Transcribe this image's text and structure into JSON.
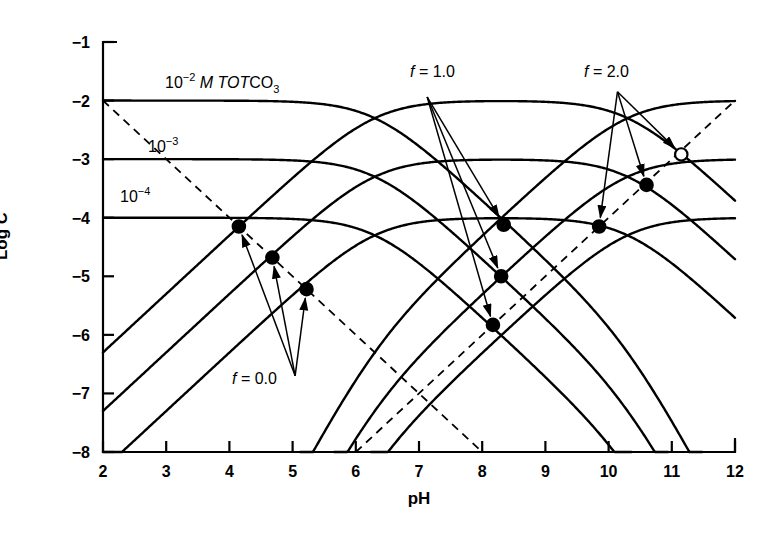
{
  "figure": {
    "background": "#ffffff",
    "line_color": "#000000"
  },
  "axes": {
    "x_title": "pH",
    "y_title_prefix": "Log ",
    "y_title_italic": "C",
    "x_ticks": [
      "2",
      "3",
      "4",
      "5",
      "6",
      "7",
      "8",
      "9",
      "10",
      "11",
      "12"
    ],
    "y_ticks": [
      "−1",
      "−2",
      "−3",
      "−4",
      "−5",
      "−6",
      "−7",
      "−8"
    ]
  },
  "curve_labels": [
    {
      "id": "tot-2",
      "mantissa": "10",
      "exponent": "−2",
      "suffix_italic": " M TOT",
      "suffix_plain": "CO",
      "sub": "3"
    },
    {
      "id": "tot-3",
      "mantissa": "10",
      "exponent": "−3"
    },
    {
      "id": "tot-4",
      "mantissa": "10",
      "exponent": "−4"
    }
  ],
  "annotations": [
    {
      "id": "f0",
      "label": "f = 0.0",
      "f_italic": "f",
      "rest": " = 0.0"
    },
    {
      "id": "f1",
      "label": "f = 1.0",
      "f_italic": "f",
      "rest": " = 1.0"
    },
    {
      "id": "f2",
      "label": "f = 2.0",
      "f_italic": "f",
      "rest": " = 2.0"
    }
  ],
  "chart_data": {
    "type": "line",
    "title": "",
    "xlabel": "pH",
    "ylabel": "Log C",
    "xlim": [
      2,
      12
    ],
    "ylim": [
      -8,
      -1
    ],
    "grid": false,
    "legend": "none",
    "system": "carbonate",
    "pK1": 6.3,
    "pK2": 10.3,
    "pKw": 14.0,
    "totals": [
      {
        "label": "10^-2 M TOTCO3",
        "logCT": -2
      },
      {
        "label": "10^-3",
        "logCT": -3
      },
      {
        "label": "10^-4",
        "logCT": -4
      }
    ],
    "species": [
      "H2CO3*",
      "HCO3-",
      "CO3 2-"
    ],
    "reference_lines": [
      {
        "name": "H+",
        "style": "dashed",
        "from": [
          2,
          -2
        ],
        "to": [
          8,
          -8
        ],
        "slope": -1
      },
      {
        "name": "OH-",
        "style": "dashed",
        "from": [
          6,
          -8
        ],
        "to": [
          12,
          -2
        ],
        "slope": 1
      }
    ],
    "equivalence_points": [
      {
        "f": 0.0,
        "CT_log": -2,
        "pH": 4.15,
        "logC": -4.15,
        "marker": "filled"
      },
      {
        "f": 0.0,
        "CT_log": -3,
        "pH": 4.68,
        "logC": -4.68,
        "marker": "filled"
      },
      {
        "f": 0.0,
        "CT_log": -4,
        "pH": 5.22,
        "logC": -5.22,
        "marker": "filled"
      },
      {
        "f": 1.0,
        "CT_log": -2,
        "pH": 8.34,
        "logC": -4.12,
        "marker": "filled"
      },
      {
        "f": 1.0,
        "CT_log": -3,
        "pH": 8.3,
        "logC": -5.0,
        "marker": "filled"
      },
      {
        "f": 1.0,
        "CT_log": -4,
        "pH": 8.17,
        "logC": -5.83,
        "marker": "filled"
      },
      {
        "f": 2.0,
        "CT_log": -2,
        "pH": 11.15,
        "logC": -2.92,
        "marker": "open"
      },
      {
        "f": 2.0,
        "CT_log": -3,
        "pH": 10.6,
        "logC": -3.44,
        "marker": "filled"
      },
      {
        "f": 2.0,
        "CT_log": -4,
        "pH": 9.85,
        "logC": -4.15,
        "marker": "filled"
      }
    ],
    "annotation_arrows": [
      {
        "label": "f = 0.0",
        "origin": [
          5.04,
          -6.7
        ],
        "targets": [
          [
            4.15,
            -4.15
          ],
          [
            4.68,
            -4.68
          ],
          [
            5.22,
            -5.22
          ]
        ]
      },
      {
        "label": "f = 1.0",
        "origin": [
          7.13,
          -1.94
        ],
        "targets": [
          [
            8.34,
            -4.12
          ],
          [
            8.3,
            -5.0
          ],
          [
            8.17,
            -5.83
          ]
        ]
      },
      {
        "label": "f = 2.0",
        "origin": [
          10.14,
          -1.85
        ],
        "targets": [
          [
            11.15,
            -2.92
          ],
          [
            10.6,
            -3.44
          ],
          [
            9.85,
            -4.15
          ]
        ]
      }
    ]
  }
}
